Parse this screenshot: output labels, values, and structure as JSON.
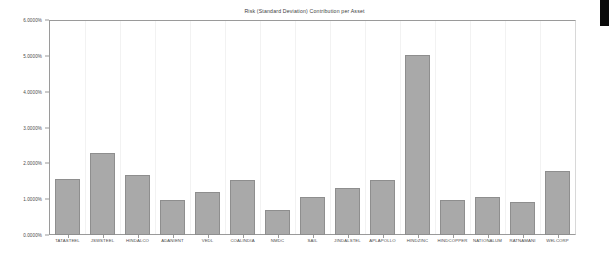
{
  "chart_data": {
    "type": "bar",
    "title": "Risk (Standard Deviation) Contribution per Asset",
    "xlabel": "",
    "ylabel": "",
    "ylim": [
      0,
      6
    ],
    "yunit": "%",
    "ytick_labels": [
      "0.0000%",
      "1.0000%",
      "2.0000%",
      "3.0000%",
      "4.0000%",
      "5.0000%",
      "6.0000%"
    ],
    "ytick_values": [
      0,
      1,
      2,
      3,
      4,
      5,
      6
    ],
    "grid": false,
    "legend": "none",
    "bar_color": "#a9a9a9",
    "bar_edge_color": "#8e8e8e",
    "axis_color": "#9a9a9a",
    "categories": [
      "TATASTEEL",
      "JSWSTEEL",
      "HINDALCO",
      "ADANIENT",
      "VEDL",
      "COALINDIA",
      "NMDC",
      "SAIL",
      "JINDALSTEL",
      "APLAPOLLO",
      "HINDZINC",
      "HINDCOPPER",
      "NATIONALUM",
      "RATNAMANI",
      "WELCORP"
    ],
    "values": [
      1.56,
      2.28,
      1.67,
      0.97,
      1.19,
      1.53,
      0.69,
      1.05,
      1.3,
      1.53,
      5.03,
      0.97,
      1.06,
      0.92,
      1.78
    ]
  }
}
